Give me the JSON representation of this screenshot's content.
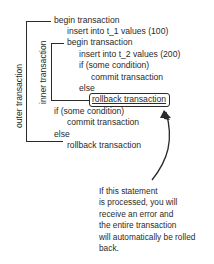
{
  "diagram": {
    "brackets": {
      "outer_label": "outer transaction",
      "inner_label": "inner transaction"
    },
    "code_lines": [
      "begin transaction",
      "insert into t_1 values (100)",
      "begin transaction",
      "insert into t_2 values (200)",
      "if (some condition)",
      "commit transaction",
      "else",
      "rollback transaction",
      "if (some condition)",
      "commit transaction",
      "else",
      "rollback transaction"
    ],
    "highlighted_line_index": 7,
    "annotation": {
      "lines": [
        "If this statement",
        "is processed, you will",
        "receive an error and",
        "the entire transaction",
        "will automatically be rolled",
        "back."
      ],
      "points_to": "rollback transaction"
    }
  }
}
